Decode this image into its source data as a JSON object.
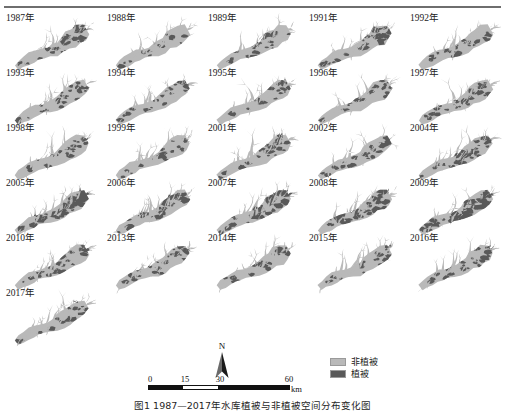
{
  "figure": {
    "caption": "图1  1987—2017年水库植被与非植被空间分布变化图",
    "has_top_rule": true
  },
  "colors": {
    "nonvegetation": "#b9b9b9",
    "vegetation": "#595959",
    "background": "#ffffff",
    "text": "#1a1a1a",
    "rule": "#6e6e6e"
  },
  "map_grid": {
    "rows": 6,
    "cols": 5,
    "panels": [
      {
        "year_label": "1987年",
        "vegetation_level": 0.3
      },
      {
        "year_label": "1988年",
        "vegetation_level": 0.1
      },
      {
        "year_label": "1989年",
        "vegetation_level": 0.16
      },
      {
        "year_label": "1991年",
        "vegetation_level": 0.34
      },
      {
        "year_label": "1992年",
        "vegetation_level": 0.2
      },
      {
        "year_label": "1993年",
        "vegetation_level": 0.22
      },
      {
        "year_label": "1994年",
        "vegetation_level": 0.13
      },
      {
        "year_label": "1995年",
        "vegetation_level": 0.17
      },
      {
        "year_label": "1996年",
        "vegetation_level": 0.14
      },
      {
        "year_label": "1997年",
        "vegetation_level": 0.26
      },
      {
        "year_label": "1998年",
        "vegetation_level": 0.12
      },
      {
        "year_label": "1999年",
        "vegetation_level": 0.11
      },
      {
        "year_label": "2001年",
        "vegetation_level": 0.23
      },
      {
        "year_label": "2002年",
        "vegetation_level": 0.25
      },
      {
        "year_label": "2004年",
        "vegetation_level": 0.33
      },
      {
        "year_label": "2005年",
        "vegetation_level": 0.52
      },
      {
        "year_label": "2006年",
        "vegetation_level": 0.4
      },
      {
        "year_label": "2007年",
        "vegetation_level": 0.45
      },
      {
        "year_label": "2008年",
        "vegetation_level": 0.42
      },
      {
        "year_label": "2009年",
        "vegetation_level": 0.58
      },
      {
        "year_label": "2010年",
        "vegetation_level": 0.28
      },
      {
        "year_label": "2013年",
        "vegetation_level": 0.21
      },
      {
        "year_label": "2014年",
        "vegetation_level": 0.19
      },
      {
        "year_label": "2015年",
        "vegetation_level": 0.15
      },
      {
        "year_label": "2016年",
        "vegetation_level": 0.24
      },
      {
        "year_label": "2017年",
        "vegetation_level": 0.13
      }
    ]
  },
  "legend": {
    "items": [
      {
        "label": "非植被",
        "swatch": "#b9b9b9"
      },
      {
        "label": "植被",
        "swatch": "#595959"
      }
    ]
  },
  "north_arrow": {
    "label": "N"
  },
  "scale_bar": {
    "ticks": [
      "0",
      "15",
      "30",
      "60"
    ],
    "unit": "km",
    "segments": [
      {
        "style": "dark",
        "span": "0-15"
      },
      {
        "style": "light",
        "span": "15-30"
      },
      {
        "style": "dark",
        "span": "30-60"
      }
    ]
  }
}
